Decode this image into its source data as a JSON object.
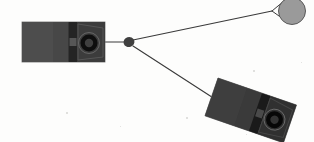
{
  "canvas": {
    "width": 314,
    "height": 142,
    "background_color": "#fdfdfc",
    "title": "two-speaker-enclosure-diagram"
  },
  "palette": {
    "background": "#fdfdfc",
    "device_body": "#4a4a4a",
    "device_body_light": "#535353",
    "device_panel_dark": "#2b2b2b",
    "device_panel_darker": "#1d1d1d",
    "device_edge": "#6b6b6b",
    "cone_ring": "#101010",
    "cone_inner": "#3d3d3d",
    "line": "#3a3a3a",
    "node_fill": "#3f3f3f",
    "circle_fill": "#9a9a9a",
    "circle_stroke": "#5a5a5a",
    "speck": "#cfcfcb"
  },
  "nodes": {
    "hub": {
      "name": "junction-node",
      "cx": 129,
      "cy": 42,
      "rx": 5.5,
      "ry": 5.0,
      "rotation": -18,
      "fill": "#3f3f3f"
    },
    "circle": {
      "name": "gray-circle-node",
      "cx": 292,
      "cy": 11,
      "r": 13.5,
      "fill": "#9a9a9a",
      "stroke": "#5a5a5a",
      "stroke_width": 1
    }
  },
  "edges": [
    {
      "name": "edge-left-device-to-hub",
      "from": "left-device",
      "to": "hub",
      "x1": 104,
      "y1": 42,
      "x2": 124,
      "y2": 42,
      "stroke": "#3a3a3a",
      "stroke_width": 1.1
    },
    {
      "name": "edge-hub-to-circle",
      "from": "hub",
      "to": "gray-circle-node",
      "x1": 133,
      "y1": 40,
      "x2": 272,
      "y2": 11,
      "stroke": "#3a3a3a",
      "stroke_width": 1.1
    },
    {
      "name": "edge-circle-tangent-upper",
      "from": "fork",
      "to": "gray-circle-node",
      "x1": 272,
      "y1": 11,
      "x2": 284,
      "y2": 1,
      "stroke": "#3a3a3a",
      "stroke_width": 1.0
    },
    {
      "name": "edge-circle-tangent-lower",
      "from": "fork",
      "to": "gray-circle-node",
      "x1": 272,
      "y1": 11,
      "x2": 286,
      "y2": 21,
      "stroke": "#3a3a3a",
      "stroke_width": 1.0
    },
    {
      "name": "edge-hub-to-right-device",
      "from": "hub",
      "to": "right-device",
      "x1": 133,
      "y1": 46,
      "x2": 218,
      "y2": 101,
      "stroke": "#3a3a3a",
      "stroke_width": 1.1
    }
  ],
  "devices": [
    {
      "name": "left-device",
      "label": "left-speaker-enclosure",
      "x": 22,
      "y": 22,
      "width": 83,
      "height": 40,
      "rotation": 0,
      "body_color": "#4a4a4a",
      "panels": [
        {
          "name": "panel-cabinet-left",
          "x": 0,
          "y": 0,
          "width": 31,
          "height": 40,
          "color": "#4d4d4d"
        },
        {
          "name": "panel-cabinet-mid",
          "x": 31,
          "y": 0,
          "width": 15.5,
          "height": 40,
          "color": "#474747"
        },
        {
          "name": "panel-grille-dark",
          "x": 46.5,
          "y": 0,
          "width": 9,
          "height": 40,
          "color": "#242424"
        },
        {
          "name": "panel-grille-gap",
          "x": 47.5,
          "y": 16,
          "width": 7,
          "height": 8,
          "color": "#565656"
        },
        {
          "name": "panel-driver-face",
          "x": 55.5,
          "y": 0,
          "width": 27.5,
          "height": 40,
          "color": "#3c3c3c"
        }
      ],
      "driver": {
        "name": "speaker-driver-cone",
        "cx": 67,
        "cy": 21,
        "outer_rx": 10.5,
        "outer_ry": 10.5,
        "ring_rx": 8.5,
        "ring_ry": 8.5,
        "inner_rx": 4.2,
        "inner_ry": 4.2,
        "ring_color": "#0e0e0e",
        "inner_color": "#3f3f3f"
      },
      "bezel": {
        "name": "driver-bezel",
        "points": "56,2 81,6 81,35 56,38",
        "color": "#555555"
      }
    },
    {
      "name": "right-device",
      "label": "right-speaker-enclosure",
      "x": 218,
      "y": 78,
      "width": 83,
      "height": 40,
      "rotation": 19,
      "body_color": "#3a3a3a",
      "panels": [
        {
          "name": "panel-cabinet-left",
          "x": 0,
          "y": 0,
          "width": 31,
          "height": 40,
          "color": "#3e3e3e"
        },
        {
          "name": "panel-cabinet-mid",
          "x": 31,
          "y": 0,
          "width": 15.5,
          "height": 40,
          "color": "#3a3a3a"
        },
        {
          "name": "panel-grille-dark",
          "x": 46.5,
          "y": 0,
          "width": 9,
          "height": 40,
          "color": "#1a1a1a"
        },
        {
          "name": "panel-grille-gap",
          "x": 47.5,
          "y": 16,
          "width": 7,
          "height": 8,
          "color": "#4a4a4a"
        },
        {
          "name": "panel-driver-face",
          "x": 55.5,
          "y": 0,
          "width": 27.5,
          "height": 40,
          "color": "#303030"
        }
      ],
      "driver": {
        "name": "speaker-driver-cone",
        "cx": 67,
        "cy": 21,
        "outer_rx": 10.5,
        "outer_ry": 10.5,
        "ring_rx": 8.5,
        "ring_ry": 8.5,
        "inner_rx": 4.2,
        "inner_ry": 4.2,
        "ring_color": "#070707",
        "inner_color": "#333333"
      },
      "bezel": {
        "name": "driver-bezel",
        "points": "56,2 81,6 81,35 56,38",
        "color": "#464646"
      }
    }
  ],
  "specks": [
    {
      "x": 253,
      "y": 70,
      "size": 1.6
    },
    {
      "x": 186,
      "y": 117,
      "size": 1.6
    },
    {
      "x": 66,
      "y": 112,
      "size": 1.5
    },
    {
      "x": 301,
      "y": 62,
      "size": 1.4
    },
    {
      "x": 120,
      "y": 126,
      "size": 1.3
    },
    {
      "x": 246,
      "y": 134,
      "size": 1.3
    }
  ]
}
